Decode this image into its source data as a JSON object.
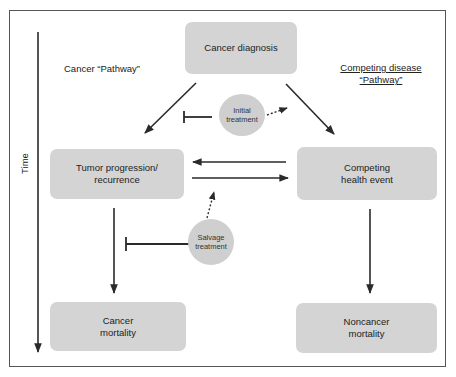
{
  "diagram": {
    "time_axis_label": "Time",
    "pathway_labels": {
      "cancer": "Cancer “Pathway”",
      "competing": "Competing disease\n“Pathway”"
    },
    "nodes": {
      "cancer_diagnosis": "Cancer diagnosis",
      "tumor_progression": "Tumor progression/\nrecurrence",
      "competing_health_event": "Competing\nhealth event",
      "cancer_mortality": "Cancer\nmortality",
      "noncancer_mortality": "Noncancer\nmortality"
    },
    "interventions": {
      "initial_treatment": "Initial\ntreatment",
      "salvage_treatment": "Salvage\ntreatment"
    },
    "edges": [
      {
        "from": "cancer_diagnosis",
        "to": "tumor_progression",
        "style": "solid-arrow"
      },
      {
        "from": "cancer_diagnosis",
        "to": "competing_health_event",
        "style": "solid-arrow"
      },
      {
        "from": "competing_health_event",
        "to": "tumor_progression",
        "style": "solid-arrow"
      },
      {
        "from": "tumor_progression",
        "to": "competing_health_event",
        "style": "solid-arrow"
      },
      {
        "from": "tumor_progression",
        "to": "cancer_mortality",
        "style": "solid-arrow"
      },
      {
        "from": "competing_health_event",
        "to": "noncancer_mortality",
        "style": "solid-arrow"
      },
      {
        "from": "initial_treatment",
        "to": "cancer_pathway",
        "style": "inhibit"
      },
      {
        "from": "initial_treatment",
        "to": "competing_pathway",
        "style": "dotted-arrow"
      },
      {
        "from": "salvage_treatment",
        "to": "cancer_mortality_path",
        "style": "inhibit"
      },
      {
        "from": "salvage_treatment",
        "to": "progression_competing_link",
        "style": "dotted-arrow"
      }
    ],
    "colors": {
      "box_fill": "#d4d4d4",
      "circle_fill": "#cfcfcf",
      "line": "#2a2a2a",
      "frame": "#555555"
    }
  }
}
